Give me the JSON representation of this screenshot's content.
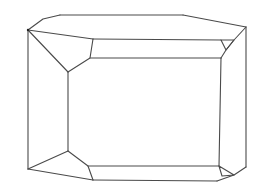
{
  "diagram": {
    "title": "",
    "stroke_color": "#4a4a4a",
    "background_color": "#ffffff",
    "stroke_width": 1.1,
    "edges": [
      {
        "name": "outer-top-left-chamfer",
        "points": [
          [
            28,
            30
          ],
          [
            43,
            19
          ],
          [
            60,
            15
          ]
        ]
      },
      {
        "name": "outer-top-edge",
        "points": [
          [
            60,
            15
          ],
          [
            183,
            15
          ]
        ]
      },
      {
        "name": "outer-top-right-edge",
        "points": [
          [
            183,
            15
          ],
          [
            246,
            27
          ]
        ]
      },
      {
        "name": "outer-right-edge",
        "points": [
          [
            246,
            27
          ],
          [
            246,
            167
          ]
        ]
      },
      {
        "name": "outer-left-edge",
        "points": [
          [
            28,
            30
          ],
          [
            28,
            169
          ]
        ]
      },
      {
        "name": "top-left-facet-upper",
        "points": [
          [
            28,
            30
          ],
          [
            93,
            39
          ]
        ]
      },
      {
        "name": "top-left-facet-lower",
        "points": [
          [
            28,
            30
          ],
          [
            68,
            72
          ]
        ]
      },
      {
        "name": "top-left-bevel",
        "points": [
          [
            93,
            39
          ],
          [
            90,
            58
          ],
          [
            68,
            72
          ]
        ]
      },
      {
        "name": "top-bevel-upper",
        "points": [
          [
            93,
            39
          ],
          [
            221,
            40
          ]
        ]
      },
      {
        "name": "top-bevel-lower",
        "points": [
          [
            90,
            58
          ],
          [
            221,
            58
          ]
        ]
      },
      {
        "name": "inner-left-edge",
        "points": [
          [
            68,
            72
          ],
          [
            68,
            151
          ]
        ]
      },
      {
        "name": "top-right-facet",
        "points": [
          [
            246,
            27
          ],
          [
            234,
            40
          ],
          [
            226,
            50
          ],
          [
            221,
            58
          ]
        ]
      },
      {
        "name": "top-right-triangle",
        "points": [
          [
            221,
            40
          ],
          [
            234,
            40
          ],
          [
            226,
            50
          ],
          [
            221,
            40
          ]
        ]
      },
      {
        "name": "inner-right-edge",
        "points": [
          [
            221,
            58
          ],
          [
            219,
            166
          ]
        ]
      },
      {
        "name": "bottom-left-facet-upper",
        "points": [
          [
            28,
            169
          ],
          [
            68,
            151
          ]
        ]
      },
      {
        "name": "bottom-left-facet-lower",
        "points": [
          [
            28,
            169
          ],
          [
            93,
            180
          ]
        ]
      },
      {
        "name": "bottom-left-bevel",
        "points": [
          [
            68,
            151
          ],
          [
            88,
            166
          ],
          [
            93,
            180
          ]
        ]
      },
      {
        "name": "bottom-bevel-upper",
        "points": [
          [
            88,
            166
          ],
          [
            219,
            166
          ]
        ]
      },
      {
        "name": "bottom-bevel-lower",
        "points": [
          [
            93,
            180
          ],
          [
            217,
            181
          ]
        ]
      },
      {
        "name": "bottom-right-facet",
        "points": [
          [
            246,
            167
          ],
          [
            234,
            175
          ],
          [
            217,
            181
          ]
        ]
      },
      {
        "name": "bottom-right-triangle",
        "points": [
          [
            219,
            166
          ],
          [
            234,
            175
          ],
          [
            222,
            176
          ],
          [
            219,
            166
          ]
        ]
      }
    ]
  }
}
